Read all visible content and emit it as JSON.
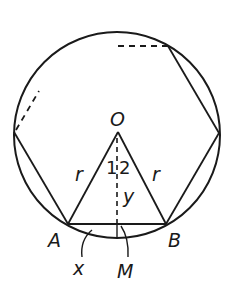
{
  "diagram": {
    "type": "geometry",
    "colors": {
      "stroke": "#1a1a1a",
      "background": "#ffffff"
    },
    "labels": {
      "center": "O",
      "vertex_a": "A",
      "vertex_b": "B",
      "midpoint": "M",
      "radius_left": "r",
      "radius_right": "r",
      "angle_1": "1",
      "angle_2": "2",
      "apothem": "y",
      "arc_segment": "x"
    }
  }
}
